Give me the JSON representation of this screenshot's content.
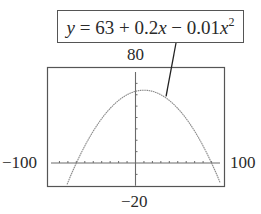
{
  "chart_data": {
    "type": "line",
    "title": "",
    "annotation": {
      "text": "y = 63 + 0.2x − 0.01x²",
      "parts": {
        "y": "y",
        "eq": " = 63 + 0.2",
        "x1": "x",
        "minus": " − 0.01",
        "x2": "x",
        "exp": "2"
      },
      "points_to_x": 35
    },
    "equation": {
      "a": -0.01,
      "b": 0.2,
      "c": 63
    },
    "xlim": [
      -100,
      100
    ],
    "ylim": [
      -20,
      80
    ],
    "x_tick_step": 10,
    "y_tick_step": 10,
    "window_labels": {
      "xmin": "−100",
      "xmax": "100",
      "ymin": "−20",
      "ymax": "80"
    },
    "series": [
      {
        "name": "y = 63 + 0.2x − 0.01x^2",
        "x": [
          -80,
          -70,
          -60,
          -50,
          -40,
          -30,
          -20,
          -10,
          0,
          10,
          20,
          30,
          40,
          50,
          60,
          70,
          80,
          90,
          100
        ],
        "values": [
          -17,
          0,
          15,
          28,
          39,
          48,
          55,
          60,
          63,
          64,
          63,
          60,
          55,
          48,
          39,
          28,
          15,
          0,
          -17
        ]
      }
    ],
    "key_points": {
      "vertex": [
        10,
        64
      ],
      "x_intercepts": [
        -70,
        90
      ],
      "y_intercept": 63
    },
    "xlabel": "",
    "ylabel": "",
    "grid": false,
    "legend": "none",
    "colors": {
      "curve": "#8a8a8a",
      "axes": "#6a6a6a",
      "frame": "#555555"
    }
  }
}
